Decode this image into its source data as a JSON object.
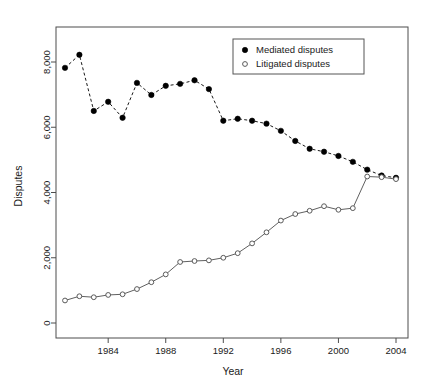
{
  "chart_data": {
    "type": "line",
    "title": "",
    "xlabel": "Year",
    "ylabel": "Disputes",
    "xlim": [
      1981,
      2004
    ],
    "ylim": [
      0,
      9000
    ],
    "grid": false,
    "legend_position": "top-right",
    "x": [
      1981,
      1982,
      1983,
      1984,
      1985,
      1986,
      1987,
      1988,
      1989,
      1990,
      1991,
      1992,
      1993,
      1994,
      1995,
      1996,
      1997,
      1998,
      1999,
      2000,
      2001,
      2002,
      2003,
      2004
    ],
    "xticks": [
      1984,
      1988,
      1992,
      1996,
      2000,
      2004
    ],
    "xtick_labels": [
      "1984",
      "1988",
      "1992",
      "1996",
      "2000",
      "2004"
    ],
    "yticks": [
      0,
      2000,
      4000,
      6000,
      8000
    ],
    "ytick_labels": [
      "0",
      "2,000",
      "4,000",
      "6,000",
      "8,000"
    ],
    "series": [
      {
        "name": "Mediated disputes",
        "marker": "filled-circle",
        "line_style": "dashed",
        "color": "#000000",
        "values": [
          7820,
          8220,
          6500,
          6780,
          6290,
          7360,
          6990,
          7270,
          7330,
          7440,
          7170,
          6200,
          6260,
          6200,
          6110,
          5890,
          5580,
          5340,
          5250,
          5120,
          4940,
          4700,
          4520,
          4450
        ]
      },
      {
        "name": "Litigated disputes",
        "marker": "open-circle",
        "line_style": "solid",
        "color": "#606060",
        "values": [
          690,
          820,
          790,
          860,
          880,
          1040,
          1250,
          1490,
          1870,
          1900,
          1920,
          2000,
          2140,
          2440,
          2780,
          3140,
          3340,
          3440,
          3580,
          3470,
          3520,
          4490,
          4470,
          4410
        ]
      }
    ]
  },
  "legend": {
    "entries": [
      {
        "label": "Mediated disputes",
        "marker": "filled-circle"
      },
      {
        "label": "Litigated disputes",
        "marker": "open-circle"
      }
    ]
  },
  "labels": {
    "x_axis_title": "Year",
    "y_axis_title": "Disputes"
  }
}
